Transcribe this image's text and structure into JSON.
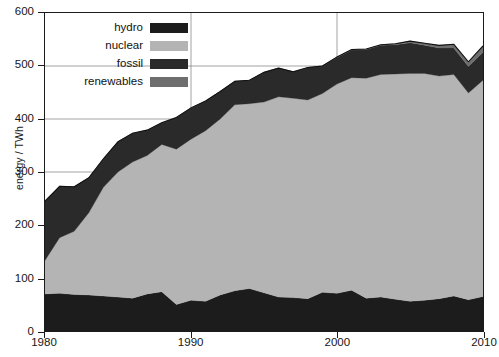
{
  "chart_data": {
    "type": "area",
    "stacked": true,
    "title": "",
    "xlabel": "",
    "ylabel": "energy / TWh",
    "xlim": [
      1980,
      2010
    ],
    "ylim": [
      0,
      600
    ],
    "xticks": [
      1980,
      1990,
      2000,
      2010
    ],
    "yticks": [
      0,
      100,
      200,
      300,
      400,
      500,
      600
    ],
    "grid": true,
    "legend_position": "top-left-inside",
    "x": [
      1980,
      1981,
      1982,
      1983,
      1984,
      1985,
      1986,
      1987,
      1988,
      1989,
      1990,
      1991,
      1992,
      1993,
      1994,
      1995,
      1996,
      1997,
      1998,
      1999,
      2000,
      2001,
      2002,
      2003,
      2004,
      2005,
      2006,
      2007,
      2008,
      2009,
      2010
    ],
    "series": [
      {
        "name": "hydro",
        "color": "#1c1c1c",
        "values": [
          70,
          71,
          69,
          68,
          66,
          64,
          62,
          70,
          74,
          50,
          58,
          56,
          68,
          76,
          80,
          72,
          64,
          63,
          61,
          73,
          71,
          77,
          62,
          64,
          60,
          56,
          58,
          61,
          66,
          59,
          65
        ]
      },
      {
        "name": "nuclear",
        "color": "#b4b4b4",
        "values": [
          63,
          105,
          119,
          155,
          205,
          236,
          257,
          261,
          278,
          293,
          304,
          322,
          332,
          351,
          349,
          360,
          378,
          376,
          375,
          375,
          395,
          401,
          415,
          420,
          425,
          430,
          428,
          420,
          418,
          390,
          408
        ]
      },
      {
        "name": "fossil",
        "color": "#2a2a2a",
        "values": [
          112,
          97,
          84,
          66,
          54,
          57,
          54,
          48,
          41,
          60,
          59,
          56,
          52,
          44,
          44,
          56,
          54,
          50,
          61,
          52,
          50,
          52,
          54,
          55,
          55,
          58,
          53,
          53,
          50,
          50,
          53
        ]
      },
      {
        "name": "renewables",
        "color": "#6e6e6e",
        "values": [
          0,
          0,
          0,
          0,
          0,
          0,
          0,
          0,
          0,
          0,
          0,
          0,
          0,
          0,
          0,
          0,
          0,
          0,
          0,
          0,
          1,
          1,
          1,
          1,
          2,
          3,
          4,
          5,
          7,
          9,
          12
        ]
      }
    ],
    "totals": [
      245,
      273,
      272,
      289,
      325,
      357,
      373,
      379,
      393,
      403,
      421,
      434,
      452,
      471,
      473,
      488,
      496,
      489,
      497,
      500,
      517,
      531,
      532,
      540,
      542,
      547,
      543,
      539,
      541,
      508,
      538
    ]
  },
  "legend": {
    "items": [
      {
        "label": "hydro",
        "color": "#1c1c1c"
      },
      {
        "label": "nuclear",
        "color": "#b4b4b4"
      },
      {
        "label": "fossil",
        "color": "#2a2a2a"
      },
      {
        "label": "renewables",
        "color": "#6e6e6e"
      }
    ]
  },
  "axes": {
    "y_label": "energy / TWh",
    "y_tick_labels": [
      "600",
      "500",
      "400",
      "300",
      "200",
      "100",
      "0"
    ],
    "x_tick_labels": [
      "1980",
      "1990",
      "2000",
      "2010"
    ]
  },
  "colors": {
    "axis": "#1b1b1b",
    "grid": "#8c8c8c",
    "background": "#ffffff",
    "text": "#161616"
  }
}
